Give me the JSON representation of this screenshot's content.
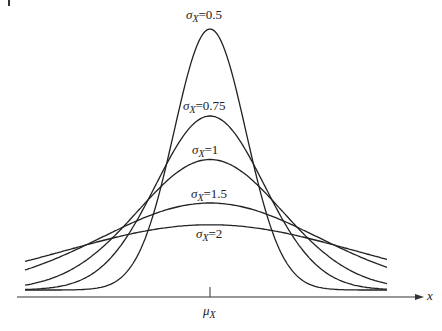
{
  "chart_data": {
    "type": "line",
    "title": "",
    "xlabel": "x",
    "ylabel": "",
    "x_tick_labels": [
      "μX"
    ],
    "grid": false,
    "legend": "inline labels above each curve",
    "series": [
      {
        "name": "σX=0.5",
        "sigma": 0.5,
        "label": "σX=0.5"
      },
      {
        "name": "σX=0.75",
        "sigma": 0.75,
        "label": "σX=0.75"
      },
      {
        "name": "σX=1",
        "sigma": 1,
        "label": "σX=1"
      },
      {
        "name": "σX=1.5",
        "sigma": 1.5,
        "label": "σX=1.5"
      },
      {
        "name": "σX=2",
        "sigma": 2,
        "label": "σX=2"
      }
    ]
  },
  "labels": {
    "s05": {
      "sym": "σ",
      "sub": "X",
      "val": "=0.5"
    },
    "s075": {
      "sym": "σ",
      "sub": "X",
      "val": "=0.75"
    },
    "s1": {
      "sym": "σ",
      "sub": "X",
      "val": "=1"
    },
    "s15": {
      "sym": "σ",
      "sub": "X",
      "val": "=1.5"
    },
    "s2": {
      "sym": "σ",
      "sub": "X",
      "val": "=2"
    },
    "mu": {
      "sym": "μ",
      "sub": "X"
    },
    "x": "x"
  }
}
